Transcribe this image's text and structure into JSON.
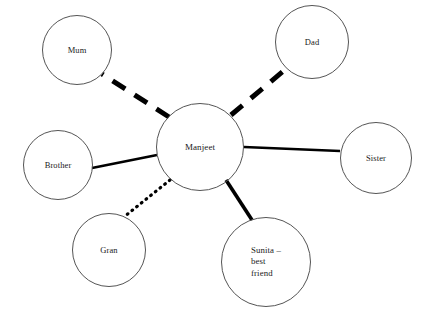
{
  "diagram": {
    "type": "ego-network-sociogram",
    "background_color": "#ffffff",
    "node_outline_color": "#555555",
    "edge_color": "#000000",
    "center": {
      "id": "manjeet",
      "label": "Manjeet",
      "cx": 200,
      "cy": 147,
      "r": 44
    },
    "nodes": [
      {
        "id": "mum",
        "label": "Mum",
        "cx": 77,
        "cy": 50,
        "r": 35
      },
      {
        "id": "dad",
        "label": "Dad",
        "cx": 312,
        "cy": 42,
        "r": 37
      },
      {
        "id": "sister",
        "label": "Sister",
        "cx": 376,
        "cy": 158,
        "r": 36
      },
      {
        "id": "brother",
        "label": "Brother",
        "cx": 58,
        "cy": 165,
        "r": 35
      },
      {
        "id": "gran",
        "label": "Gran",
        "cx": 109,
        "cy": 250,
        "r": 37
      },
      {
        "id": "sunita",
        "label": "Sunita –\nbest\nfriend",
        "cx": 266,
        "cy": 262,
        "r": 45
      }
    ],
    "edges": [
      {
        "id": "edge-manjeet-mum",
        "from": "manjeet",
        "to": "mum",
        "style": "dashed",
        "width": 5,
        "x1": 169,
        "y1": 117,
        "x2": 102,
        "y2": 74
      },
      {
        "id": "edge-manjeet-dad",
        "from": "manjeet",
        "to": "dad",
        "style": "dashed",
        "width": 5,
        "x1": 231,
        "y1": 115,
        "x2": 287,
        "y2": 68
      },
      {
        "id": "edge-manjeet-sister",
        "from": "manjeet",
        "to": "sister",
        "style": "solid",
        "width": 2.6,
        "x1": 244,
        "y1": 147,
        "x2": 340,
        "y2": 151
      },
      {
        "id": "edge-manjeet-brother",
        "from": "manjeet",
        "to": "brother",
        "style": "solid",
        "width": 2.4,
        "x1": 157,
        "y1": 155,
        "x2": 92,
        "y2": 168
      },
      {
        "id": "edge-manjeet-gran",
        "from": "manjeet",
        "to": "gran",
        "style": "dotted",
        "width": 3.2,
        "x1": 170,
        "y1": 180,
        "x2": 124,
        "y2": 217
      },
      {
        "id": "edge-manjeet-sunita",
        "from": "manjeet",
        "to": "sunita",
        "style": "solid",
        "width": 3.6,
        "x1": 226,
        "y1": 180,
        "x2": 252,
        "y2": 220
      }
    ]
  }
}
